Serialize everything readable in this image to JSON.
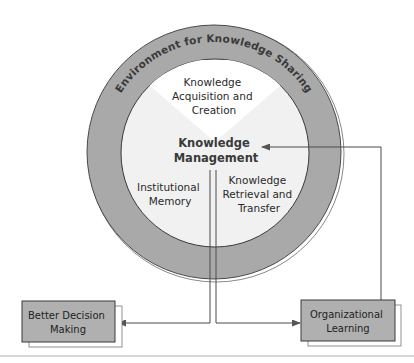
{
  "diagram": {
    "ring_label": "Environment for Knowledge Sharing",
    "center_label": [
      "Knowledge",
      "Management"
    ],
    "sectors": {
      "acquisition": [
        "Knowledge",
        "Acquisition and",
        "Creation"
      ],
      "memory": [
        "Institutional",
        "Memory"
      ],
      "retrieval": [
        "Knowledge",
        "Retrieval and",
        "Transfer"
      ]
    },
    "outcomes": {
      "decision": [
        "Better Decision",
        "Making"
      ],
      "learning": [
        "Organizational",
        "Learning"
      ]
    },
    "colors": {
      "ring_fill": "#a9a9a9",
      "inner_fill": "#f1f1f1",
      "top_wedge_fill": "#ffffff",
      "box_fill": "#b0b0b0",
      "stroke": "#4a4a4a",
      "divider": "#d6d6d6"
    },
    "connections": [
      {
        "from": "Knowledge Management",
        "to": "Better Decision Making"
      },
      {
        "from": "Knowledge Management",
        "to": "Organizational Learning"
      },
      {
        "from": "Organizational Learning",
        "to": "Knowledge Management"
      }
    ]
  }
}
